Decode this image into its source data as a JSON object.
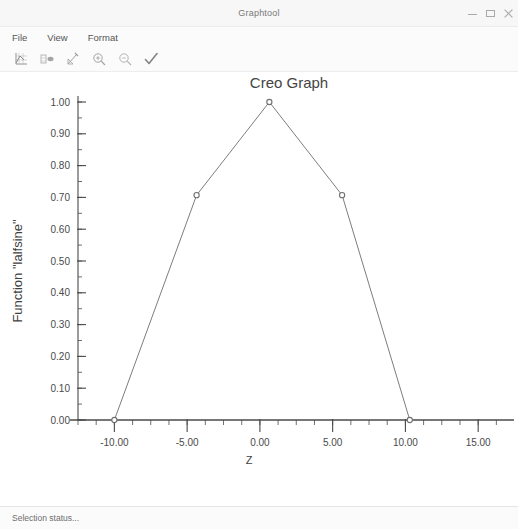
{
  "window": {
    "title": "Graphtool",
    "controls": [
      {
        "name": "minimize",
        "label": "–"
      },
      {
        "name": "maximize",
        "label": "□"
      },
      {
        "name": "close",
        "label": "✕"
      }
    ]
  },
  "menu": {
    "items": [
      {
        "label": "File"
      },
      {
        "label": "View"
      },
      {
        "label": "Format"
      }
    ]
  },
  "toolbar": {
    "buttons": [
      {
        "icon": "graph-axes-icon",
        "title": "Graph"
      },
      {
        "icon": "table-view-icon",
        "title": "Table"
      },
      {
        "icon": "edit-curve-icon",
        "title": "Edit Curve"
      },
      {
        "icon": "zoom-in-icon",
        "title": "Zoom In"
      },
      {
        "icon": "zoom-out-icon",
        "title": "Zoom Out"
      },
      {
        "icon": "accept-check-icon",
        "title": "Accept"
      }
    ]
  },
  "statusbar": {
    "text": "Selection status..."
  },
  "chart_data": {
    "type": "line",
    "title": "Creo Graph",
    "xlabel": "Z",
    "ylabel": "Function \"lalfsine\"",
    "xlim": [
      -12.5,
      16.5
    ],
    "ylim": [
      0.0,
      1.0
    ],
    "xticks": [
      -10.0,
      -5.0,
      0.0,
      5.0,
      10.0,
      15.0
    ],
    "xtick_labels": [
      "-10.00",
      "-5.00",
      "0.00",
      "5.00",
      "10.00",
      "15.00"
    ],
    "xminor_step": 1.25,
    "yticks": [
      0.0,
      0.1,
      0.2,
      0.3,
      0.4,
      0.5,
      0.6,
      0.7,
      0.8,
      0.9,
      1.0
    ],
    "ytick_labels": [
      "0.00",
      "0.10",
      "0.20",
      "0.30",
      "0.40",
      "0.50",
      "0.60",
      "0.70",
      "0.80",
      "0.90",
      "1.00"
    ],
    "yminor_step": 0.05,
    "grid": false,
    "legend": false,
    "line_color": "#7d7d7d",
    "marker_color": "#6f6f6f",
    "axis_color": "#4a4a4a",
    "series": [
      {
        "name": "lalfsine",
        "x": [
          -10.0,
          -4.35,
          0.65,
          5.65,
          10.3
        ],
        "y": [
          0.0,
          0.707,
          1.0,
          0.707,
          0.0
        ],
        "markers": true
      }
    ]
  }
}
